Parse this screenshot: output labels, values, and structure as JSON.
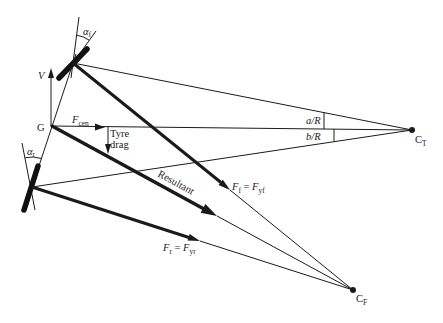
{
  "figure": {
    "colors": {
      "ink": "#1a1a1a",
      "background": "#ffffff"
    }
  },
  "labels": {
    "velocity": "V",
    "cg": "G",
    "f_cen": {
      "symbol": "F",
      "sub": "cen"
    },
    "tyre_drag": {
      "line1": "Tyre",
      "line2": "drag"
    },
    "alpha_f": {
      "symbol": "α",
      "sub": "f"
    },
    "alpha_r": {
      "symbol": "α",
      "sub": "r"
    },
    "a_over_r": "a/R",
    "b_over_r": "b/R",
    "turn_centre": {
      "symbol": "C",
      "sub": "T"
    },
    "force_centre": {
      "symbol": "C",
      "sub": "F"
    },
    "resultant": "Resultant",
    "front_force": {
      "lhs": "F",
      "lhs_sub": "f",
      "eq": " = ",
      "rhs": "F",
      "rhs_sub": "yf"
    },
    "rear_force": {
      "lhs": "F",
      "lhs_sub": "r",
      "eq": " = ",
      "rhs": "F",
      "rhs_sub": "yr"
    }
  }
}
